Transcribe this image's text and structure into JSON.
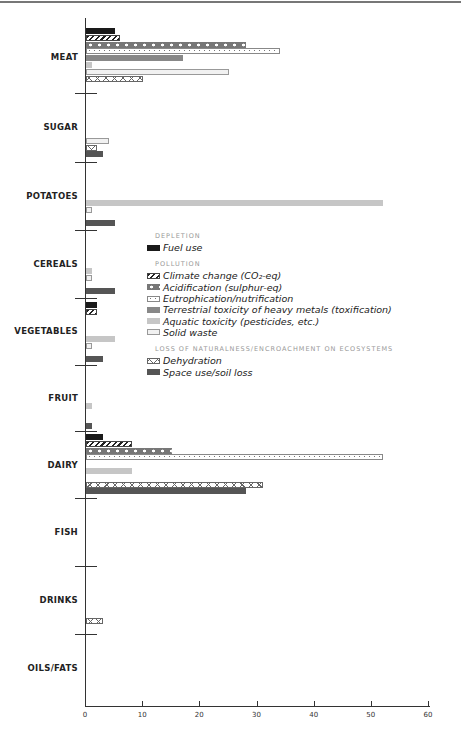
{
  "chart_data": {
    "type": "bar",
    "orientation": "horizontal",
    "title": "",
    "xlabel": "",
    "ylabel": "",
    "xlim": [
      0,
      60
    ],
    "xticks": [
      0,
      10,
      20,
      30,
      40,
      50,
      60
    ],
    "grid": false,
    "legend_position": "inside-center",
    "categories": [
      "MEAT",
      "SUGAR",
      "POTATOES",
      "CEREALS",
      "VEGETABLES",
      "FRUIT",
      "DAIRY",
      "FISH",
      "DRINKS",
      "OILS/FATS"
    ],
    "legend_groups": [
      {
        "heading": "DEPLETION",
        "items": [
          "Fuel use"
        ]
      },
      {
        "heading": "POLLUTION",
        "items": [
          "Climate change (CO2-eq)",
          "Acidification (sulphur-eq)",
          "Eutrophication/nutrification",
          "Terrestrial toxicity of heavy metals (toxification)",
          "Aquatic toxicity (pesticides, etc.)",
          "Solid waste"
        ]
      },
      {
        "heading": "LOSS OF NATURALNESS/ENCROACHMENT ON ECOSYSTEMS",
        "items": [
          "Dehydration",
          "Space use/soil loss"
        ]
      }
    ],
    "series": [
      {
        "name": "Fuel use",
        "key": "fuel",
        "values": [
          5,
          0,
          0,
          0,
          2,
          0,
          3,
          0,
          0,
          0
        ]
      },
      {
        "name": "Climate change (CO2-eq)",
        "key": "climate",
        "values": [
          6,
          0,
          0,
          0,
          2,
          0,
          8,
          0,
          0,
          0
        ]
      },
      {
        "name": "Acidification (sulphur-eq)",
        "key": "acid",
        "values": [
          28,
          0,
          0,
          0,
          0,
          0,
          15,
          0,
          0,
          0
        ]
      },
      {
        "name": "Eutrophication/nutrification",
        "key": "eutro",
        "values": [
          34,
          0,
          0,
          0,
          0,
          0,
          52,
          0,
          0,
          0
        ]
      },
      {
        "name": "Terrestrial toxicity of heavy metals (toxification)",
        "key": "terr",
        "values": [
          17,
          0,
          0,
          0,
          0,
          0,
          0,
          0,
          0,
          0
        ]
      },
      {
        "name": "Aquatic toxicity (pesticides, etc.)",
        "key": "aqua",
        "values": [
          1,
          0,
          52,
          1,
          5,
          1,
          8,
          0,
          0,
          0
        ]
      },
      {
        "name": "Solid waste",
        "key": "solid",
        "values": [
          25,
          4,
          1,
          1,
          1,
          0,
          0,
          0,
          0,
          0
        ]
      },
      {
        "name": "Dehydration",
        "key": "dehyd",
        "values": [
          10,
          2,
          0,
          0,
          0,
          0,
          31,
          0,
          3,
          0
        ]
      },
      {
        "name": "Space use/soil loss",
        "key": "space",
        "values": [
          0,
          3,
          5,
          5,
          3,
          1,
          28,
          0,
          0,
          0
        ]
      }
    ]
  },
  "legend": {
    "depletion_heading": "DEPLETION",
    "fuel": "Fuel use",
    "pollution_heading": "POLLUTION",
    "climate": "Climate change (CO₂-eq)",
    "acid": "Acidification (sulphur-eq)",
    "eutro": "Eutrophication/nutrification",
    "terr": "Terrestrial toxicity of heavy metals (toxification)",
    "aqua": "Aquatic toxicity (pesticides, etc.)",
    "solid": "Solid waste",
    "loss_heading": "LOSS OF NATURALNESS/ENCROACHMENT ON ECOSYSTEMS",
    "dehyd": "Dehydration",
    "space": "Space use/soil loss"
  },
  "labels": {
    "meat": "MEAT",
    "sugar": "SUGAR",
    "potatoes": "POTATOES",
    "cereals": "CEREALS",
    "vegetables": "VEGETABLES",
    "fruit": "FRUIT",
    "dairy": "DAIRY",
    "fish": "FISH",
    "drinks": "DRINKS",
    "oils": "OILS/FATS"
  },
  "ticks": [
    "0",
    "10",
    "20",
    "30",
    "40",
    "50",
    "60"
  ]
}
